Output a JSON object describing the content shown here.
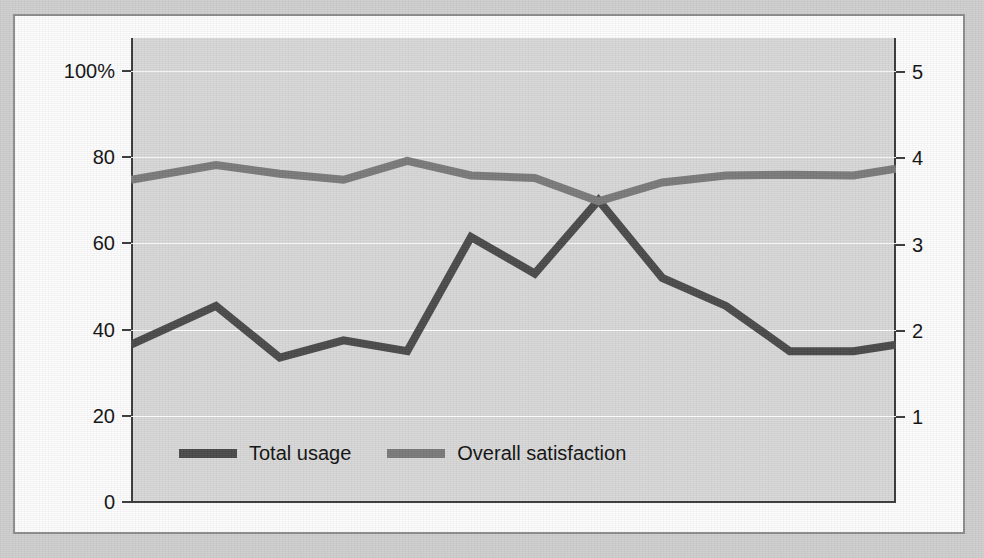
{
  "chart_data": {
    "type": "line",
    "title": "",
    "subtitle": "",
    "xlabel": "",
    "ylabel": "(Percentage of respondents)",
    "y2label": "(5 = highest satisfaction)",
    "grid": true,
    "legend_position": "inside-bottom-left",
    "x": [
      1996,
      1998,
      1999.5,
      2001,
      2002.5,
      2004,
      2005.5,
      2007,
      2008.5,
      2010,
      2011.5,
      2013,
      2014
    ],
    "xtick_labels": [
      "1996",
      "2014"
    ],
    "xlim": [
      1996,
      2014
    ],
    "ylim": [
      0,
      100
    ],
    "ytick_labels": [
      "100%",
      "80",
      "60",
      "40",
      "20",
      "0"
    ],
    "ytick_values": [
      100,
      80,
      60,
      40,
      20,
      0
    ],
    "y2lim": [
      0,
      5.8
    ],
    "y2tick_labels": [
      "5",
      "4",
      "3",
      "2",
      "1"
    ],
    "y2tick_values": [
      5,
      4,
      3,
      2,
      1
    ],
    "series": [
      {
        "name": "Total usage",
        "axis": "left",
        "unit": "percent",
        "color": "#4a4a4a",
        "values": [
          36.5,
          45.5,
          33.5,
          37.5,
          35.0,
          61.5,
          53.0,
          70.0,
          52.0,
          45.5,
          35.0,
          35.0,
          36.5
        ]
      },
      {
        "name": "Overall satisfaction",
        "axis": "right",
        "unit": "rating",
        "color": "#7a7a7a",
        "values": [
          3.75,
          3.92,
          3.82,
          3.75,
          3.97,
          3.8,
          3.77,
          3.5,
          3.72,
          3.8,
          3.81,
          3.8,
          3.88
        ]
      }
    ],
    "annotations": []
  },
  "legend": {
    "items": [
      {
        "label": "Total usage",
        "color": "#4a4a4a"
      },
      {
        "label": "Overall satisfaction",
        "color": "#7a7a7a"
      }
    ]
  },
  "axes": {
    "left": {
      "title": "(Percentage of respondents)",
      "ticks": [
        {
          "label": "100%",
          "value": 100
        },
        {
          "label": "80",
          "value": 80
        },
        {
          "label": "60",
          "value": 60
        },
        {
          "label": "40",
          "value": 40
        },
        {
          "label": "20",
          "value": 20
        },
        {
          "label": "0",
          "value": 0
        }
      ]
    },
    "right": {
      "title": "(5 = highest satisfaction)",
      "ticks": [
        {
          "label": "5",
          "value": 5
        },
        {
          "label": "4",
          "value": 4
        },
        {
          "label": "3",
          "value": 3
        },
        {
          "label": "2",
          "value": 2
        },
        {
          "label": "1",
          "value": 1
        }
      ]
    },
    "bottom": {
      "start_label": "1996",
      "end_label": "2014"
    }
  },
  "colors": {
    "page_background": "#cfcfcf",
    "figure_background": "#fdfdfd",
    "plot_background": "#d8d8d8",
    "axis": "#3a3a3a",
    "gridline": "#ffffff",
    "usage_line": "#4a4a4a",
    "satisfaction_line": "#7a7a7a",
    "text": "#111111"
  }
}
